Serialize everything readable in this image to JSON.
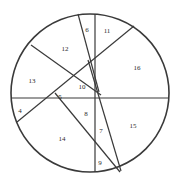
{
  "figure": {
    "type": "circle-chord-partition-diagram",
    "background_color": "#ffffff",
    "stroke_color": "#3a3a3a",
    "label_color": "#2b2b2b",
    "canvas": {
      "width": 178,
      "height": 186
    },
    "circle": {
      "cx": 90,
      "cy": 93,
      "r": 79,
      "stroke_width": 1.6
    },
    "chords": [
      {
        "name": "horizontal-diameter",
        "x1": 11,
        "y1": 98,
        "x2": 169,
        "y2": 98
      },
      {
        "name": "vertical-chord",
        "x1": 95,
        "y1": 14,
        "x2": 95,
        "y2": 172
      },
      {
        "name": "chord-top-left-steep",
        "x1": 78,
        "y1": 14,
        "x2": 99,
        "y2": 92
      },
      {
        "name": "chord-upper-left-to-lower-center",
        "x1": 31,
        "y1": 45,
        "x2": 101,
        "y2": 95
      },
      {
        "name": "chord-lower-left-to-upper-right",
        "x1": 17,
        "y1": 122,
        "x2": 134,
        "y2": 26
      },
      {
        "name": "chord-upper-center-to-bottom-right",
        "x1": 88,
        "y1": 60,
        "x2": 121,
        "y2": 171
      },
      {
        "name": "chord-left-center-to-bottom-right",
        "x1": 55,
        "y1": 93,
        "x2": 120,
        "y2": 172
      }
    ],
    "regions": [
      {
        "id": "region-6",
        "label": "6",
        "x": 87,
        "y": 30
      },
      {
        "id": "region-11",
        "label": "11",
        "x": 107,
        "y": 31
      },
      {
        "id": "region-12",
        "label": "12",
        "x": 65,
        "y": 49
      },
      {
        "id": "region-16",
        "label": "16",
        "x": 137,
        "y": 68
      },
      {
        "id": "region-13",
        "label": "13",
        "x": 32,
        "y": 81
      },
      {
        "id": "region-10",
        "label": "10",
        "x": 82,
        "y": 87
      },
      {
        "id": "region-5",
        "label": "5",
        "x": 60,
        "y": 97
      },
      {
        "id": "region-4",
        "label": "4",
        "x": 20,
        "y": 111
      },
      {
        "id": "region-8",
        "label": "8",
        "x": 86,
        "y": 114
      },
      {
        "id": "region-7",
        "label": "7",
        "x": 101,
        "y": 131
      },
      {
        "id": "region-15",
        "label": "15",
        "x": 133,
        "y": 126
      },
      {
        "id": "region-14",
        "label": "14",
        "x": 62,
        "y": 139
      },
      {
        "id": "region-9",
        "label": "9",
        "x": 100,
        "y": 163
      }
    ]
  }
}
